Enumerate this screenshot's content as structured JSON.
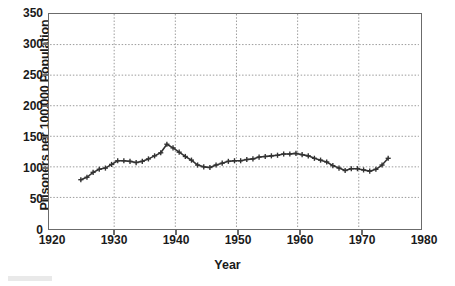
{
  "chart_data": {
    "type": "line",
    "title": "",
    "xlabel": "Year",
    "ylabel": "Prisoners per 100,000 Population",
    "xlim": [
      1920,
      1980
    ],
    "ylim": [
      0,
      350
    ],
    "xticks": [
      1920,
      1930,
      1940,
      1950,
      1960,
      1970,
      1980
    ],
    "yticks": [
      0,
      50,
      100,
      150,
      200,
      250,
      300,
      350
    ],
    "grid": "dotted gridlines at every y tick and every x tick",
    "legend": "none",
    "marker": "plus",
    "line_color": "#333333",
    "x": [
      1925,
      1926,
      1927,
      1928,
      1929,
      1930,
      1931,
      1932,
      1933,
      1934,
      1935,
      1936,
      1937,
      1938,
      1939,
      1940,
      1941,
      1942,
      1943,
      1944,
      1945,
      1946,
      1947,
      1948,
      1949,
      1950,
      1951,
      1952,
      1953,
      1954,
      1955,
      1956,
      1957,
      1958,
      1959,
      1960,
      1961,
      1962,
      1963,
      1964,
      1965,
      1966,
      1967,
      1968,
      1969,
      1970,
      1971,
      1972,
      1973,
      1974,
      1975
    ],
    "values": [
      79,
      83,
      91,
      96,
      98,
      104,
      110,
      110,
      109,
      107,
      109,
      113,
      118,
      123,
      137,
      131,
      124,
      117,
      111,
      103,
      100,
      99,
      103,
      106,
      109,
      110,
      110,
      112,
      113,
      116,
      117,
      118,
      119,
      121,
      121,
      122,
      120,
      118,
      114,
      111,
      108,
      102,
      98,
      94,
      97,
      97,
      95,
      93,
      96,
      103,
      114
    ],
    "annotations": []
  },
  "axis": {
    "y_label": "Prisoners per 100,000 Population",
    "x_label": "Year",
    "y_ticks": [
      "0",
      "50",
      "100",
      "150",
      "200",
      "250",
      "300",
      "350"
    ],
    "x_ticks": [
      "1920",
      "1930",
      "1940",
      "1950",
      "1960",
      "1970",
      "1980"
    ]
  },
  "colors": {
    "line": "#333333",
    "grid": "#9a9a9a",
    "frame": "#6b6b6b",
    "text": "#1a1a1a",
    "background": "#ffffff"
  }
}
